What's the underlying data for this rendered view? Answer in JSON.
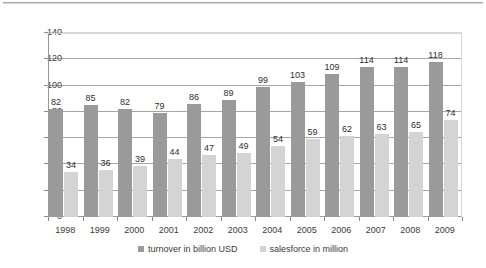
{
  "chart_data": {
    "type": "bar",
    "title": "",
    "subtitle": "",
    "xlabel": "",
    "ylabel": "",
    "ylim": [
      0,
      140
    ],
    "ytick_step": 20,
    "ytick_labels": [
      "0",
      "20",
      "40",
      "60",
      "80",
      "100",
      "120",
      "140"
    ],
    "grid": true,
    "legend_position": "bottom-center",
    "orientation": "vertical",
    "grouping": "clustered",
    "categories": [
      "1998",
      "1999",
      "2000",
      "2001",
      "2002",
      "2003",
      "2004",
      "2005",
      "2006",
      "2007",
      "2008",
      "2009"
    ],
    "series": [
      {
        "name": "turnover in billion USD",
        "color": "#9a9a9a",
        "values": [
          82,
          85,
          82,
          79,
          86,
          89,
          99,
          103,
          109,
          114,
          114,
          118
        ],
        "labels": [
          "82",
          "85",
          "82",
          "79",
          "86",
          "89",
          "99",
          "103",
          "109",
          "114",
          "114",
          "118"
        ]
      },
      {
        "name": "salesforce in million",
        "color": "#d4d4d4",
        "values": [
          34,
          36,
          39,
          44,
          47,
          49,
          54,
          59,
          62,
          63,
          65,
          74
        ],
        "labels": [
          "34",
          "36",
          "39",
          "44",
          "47",
          "49",
          "54",
          "59",
          "62",
          "63",
          "65",
          "74"
        ]
      }
    ]
  },
  "colors": {
    "series_turnover": "#9a9a9a",
    "series_salesforce": "#d4d4d4",
    "axis": "#8a8a8a",
    "gridline": "#a6a6a6",
    "text": "#3b3b3b",
    "background": "#ffffff"
  }
}
